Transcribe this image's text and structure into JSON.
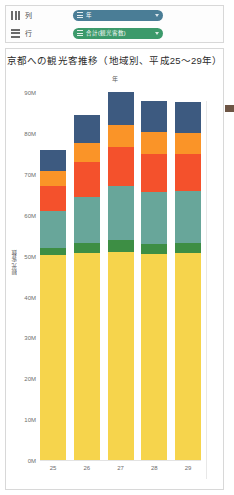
{
  "shelf": {
    "rows": [
      {
        "icon": "columns-shelf-icon",
        "label": "列",
        "pill": {
          "label": "年",
          "color": "#4a7d96"
        }
      },
      {
        "icon": "rows-shelf-icon",
        "label": "行",
        "pill": {
          "label": "合計(観光客数)",
          "color": "#3c9a6b"
        }
      }
    ]
  },
  "chart_data": {
    "type": "bar",
    "title": "京都への観光客推移（地域別、平成25〜29年）",
    "xlabel": "年",
    "ylabel": "観光客数",
    "stacked": true,
    "grid": false,
    "legend_position": "none",
    "categories": [
      "25",
      "26",
      "27",
      "28",
      "29"
    ],
    "ytick_labels": [
      "90M",
      "80M",
      "70M",
      "60M",
      "50M",
      "40M",
      "30M",
      "20M",
      "10M",
      "0M"
    ],
    "ytick_values": [
      90,
      80,
      70,
      60,
      50,
      40,
      30,
      20,
      10,
      0
    ],
    "ylim": [
      0,
      92
    ],
    "yunit": "M",
    "series": [
      {
        "name": "yellow-region",
        "color": "#f6d44c",
        "values": [
          50.5,
          51.0,
          51.2,
          50.6,
          50.8
        ]
      },
      {
        "name": "green-region",
        "color": "#3d8e44",
        "values": [
          1.6,
          2.3,
          3.0,
          2.4,
          2.6
        ]
      },
      {
        "name": "teal-region",
        "color": "#68a69a",
        "values": [
          9.0,
          11.3,
          13.0,
          12.8,
          12.6
        ]
      },
      {
        "name": "orange-red-region",
        "color": "#f4512c",
        "values": [
          6.2,
          8.6,
          9.6,
          9.4,
          9.2
        ]
      },
      {
        "name": "orange-region",
        "color": "#fa9428",
        "values": [
          3.6,
          4.6,
          5.4,
          5.2,
          5.0
        ]
      },
      {
        "name": "navy-region",
        "color": "#3d5a80",
        "values": [
          5.2,
          6.8,
          8.0,
          7.8,
          7.6
        ]
      }
    ],
    "totals": [
      76.1,
      84.6,
      90.2,
      88.2,
      87.8
    ]
  }
}
